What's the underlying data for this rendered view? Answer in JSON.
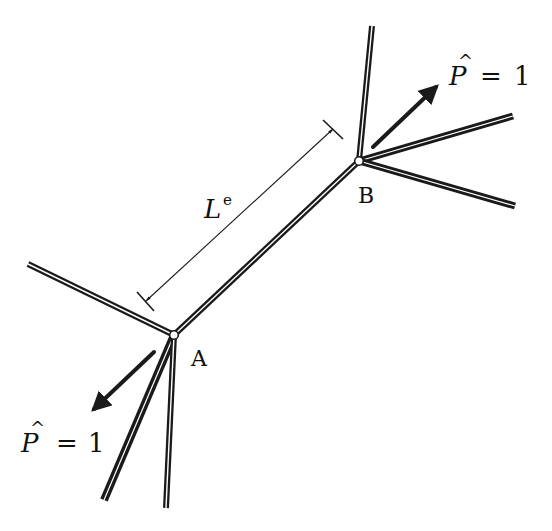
{
  "figure": {
    "type": "truss element diagram",
    "element_length_label": "L",
    "element_length_superscript": "e",
    "nodes": [
      {
        "id": "A",
        "label": "A",
        "x": 174,
        "y": 335
      },
      {
        "id": "B",
        "label": "B",
        "x": 359,
        "y": 161
      }
    ],
    "loads": [
      {
        "at": "B",
        "symbol": "P",
        "hat": "^",
        "equals": "=",
        "value": "1",
        "text": "P̂ = 1",
        "direction": "up-right"
      },
      {
        "at": "A",
        "symbol": "P",
        "hat": "^",
        "equals": "=",
        "value": "1",
        "text": "P̂ = 1",
        "direction": "down-left"
      }
    ],
    "members": [
      {
        "from": "A",
        "to": "B",
        "role": "element e"
      },
      {
        "from": "B",
        "to": "top",
        "role": "adjacent member"
      },
      {
        "from": "B",
        "to": "upper-right",
        "role": "adjacent member"
      },
      {
        "from": "B",
        "to": "lower-right",
        "role": "adjacent member"
      },
      {
        "from": "A",
        "to": "left",
        "role": "adjacent member"
      },
      {
        "from": "A",
        "to": "bottom-left",
        "role": "adjacent member"
      },
      {
        "from": "A",
        "to": "bottom",
        "role": "adjacent member"
      }
    ],
    "colors": {
      "ink": "#1a1a1a",
      "background": "#ffffff"
    }
  }
}
